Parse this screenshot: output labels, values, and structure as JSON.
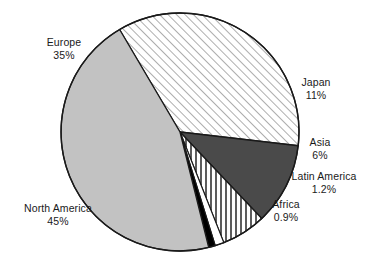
{
  "chart_data": {
    "type": "pie",
    "title": "",
    "subtitle": "",
    "xlabel": "",
    "ylabel": "",
    "legend_position": "none",
    "grid": false,
    "categories": [
      "Europe",
      "Japan",
      "Asia",
      "Latin America",
      "Africa",
      "North America"
    ],
    "values": [
      35,
      11,
      6,
      1.2,
      0.9,
      45
    ],
    "value_labels": [
      "35%",
      "11%",
      "6%",
      "1.2%",
      "0.9%",
      "45%"
    ],
    "units": "percent",
    "slices": [
      {
        "name": "Europe",
        "value": 35,
        "value_label": "35%",
        "fill_style": "diagonal-hatch",
        "fill_color": "#ffffff",
        "line_color": "#808080",
        "start_angle_deg": 300.5,
        "end_angle_deg": 66.5
      },
      {
        "name": "Japan",
        "value": 11,
        "value_label": "11%",
        "fill_style": "solid",
        "fill_color": "#4a4a4a",
        "line_color": "#000000",
        "start_angle_deg": 66.5,
        "end_angle_deg": 106.1
      },
      {
        "name": "Asia",
        "value": 6,
        "value_label": "6%",
        "fill_style": "vertical-stripes",
        "fill_color": "#ffffff",
        "line_color": "#4a4a4a",
        "start_angle_deg": 106.1,
        "end_angle_deg": 127.7
      },
      {
        "name": "Latin America",
        "value": 1.2,
        "value_label": "1.2%",
        "fill_style": "solid",
        "fill_color": "#ffffff",
        "line_color": "#000000",
        "start_angle_deg": 127.7,
        "end_angle_deg": 132.0
      },
      {
        "name": "Africa",
        "value": 0.9,
        "value_label": "0.9%",
        "fill_style": "solid",
        "fill_color": "#000000",
        "line_color": "#000000",
        "start_angle_deg": 132.0,
        "end_angle_deg": 135.3
      },
      {
        "name": "North America",
        "value": 45,
        "value_label": "45%",
        "fill_style": "solid",
        "fill_color": "#c2c2c2",
        "line_color": "#000000",
        "start_angle_deg": 135.3,
        "end_angle_deg": 300.5
      }
    ],
    "labels": {
      "europe": {
        "name": "Europe",
        "value": "35%"
      },
      "japan": {
        "name": "Japan",
        "value": "11%"
      },
      "asia": {
        "name": "Asia",
        "value": "6%"
      },
      "latin_america": {
        "name": "Latin America",
        "value": "1.2%"
      },
      "africa": {
        "name": "Africa",
        "value": "0.9%"
      },
      "north_america": {
        "name": "North America",
        "value": "45%"
      }
    },
    "geometry": {
      "center_x": 180,
      "center_y": 132,
      "radius": 119
    },
    "colors": {
      "outline": "#1a1a1a",
      "text": "#1a1a1a",
      "background": "#ffffff",
      "light_gray": "#c2c2c2",
      "dark_gray": "#4a4a4a",
      "black": "#000000",
      "white": "#ffffff"
    }
  }
}
